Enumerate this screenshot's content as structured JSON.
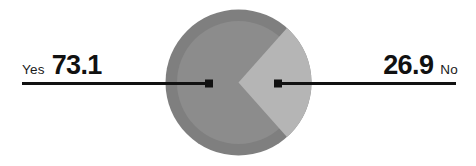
{
  "chart_data": {
    "type": "pie",
    "title": "",
    "categories": [
      "Yes",
      "No"
    ],
    "values": [
      73.1,
      26.9
    ],
    "labels": [
      "73.1",
      "26.9"
    ],
    "units": "percent",
    "legend": "none",
    "grid": false,
    "series": [
      {
        "name": "Response share",
        "values": [
          73.1,
          26.9
        ]
      }
    ],
    "slices": [
      {
        "label": "Yes",
        "value": 73.1,
        "value_text": "73.1",
        "color": "#8c8c8c",
        "start_angle_deg": 48.4,
        "end_angle_deg": 311.6
      },
      {
        "label": "No",
        "value": 26.9,
        "value_text": "26.9",
        "color": "#b5b5b5",
        "start_angle_deg": -48.4,
        "end_angle_deg": 48.4
      }
    ]
  },
  "colors": {
    "background": "#ffffff",
    "outer_ring": "#7f7f7f",
    "slice_yes": "#8c8c8c",
    "slice_no": "#b5b5b5",
    "leader_line": "#111111",
    "text": "#111111"
  },
  "callouts": {
    "left": {
      "category": "Yes",
      "value": "73.1"
    },
    "right": {
      "value": "26.9",
      "category": "No"
    }
  }
}
